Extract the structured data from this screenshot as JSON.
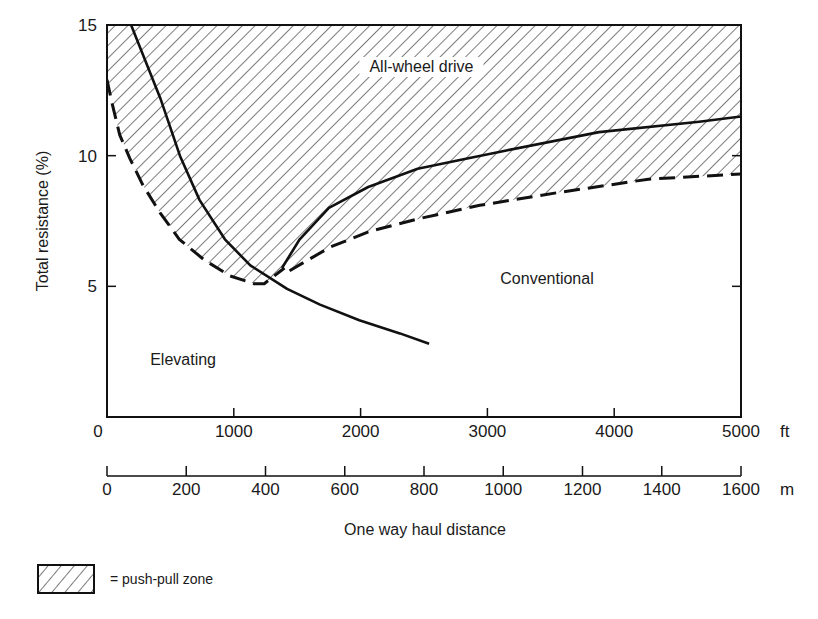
{
  "chart_data": {
    "type": "line",
    "title": "",
    "xlabel": "One way haul distance",
    "ylabel": "Total resistance (%)",
    "xlim": [
      0,
      5000
    ],
    "ylim": [
      0,
      15
    ],
    "x_unit": "ft",
    "x2_unit": "m",
    "x_ticks": [
      0,
      1000,
      2000,
      3000,
      4000,
      5000
    ],
    "x_tick_labels": [
      "0",
      "1000",
      "2000",
      "3000",
      "4000",
      "5000"
    ],
    "x2_ticks_m": [
      0,
      200,
      400,
      600,
      800,
      1000,
      1200,
      1400,
      1600
    ],
    "x2_tick_labels": [
      "0",
      "200",
      "400",
      "600",
      "800",
      "1000",
      "1200",
      "1400",
      "1600"
    ],
    "y_ticks": [
      5,
      10,
      15
    ],
    "y_tick_labels": [
      "5",
      "10",
      "15"
    ],
    "y_zero_label": "0",
    "grid": false,
    "series": [
      {
        "name": "Elevating / all-wheel boundary",
        "style": "solid",
        "points": [
          [
            190,
            15
          ],
          [
            420,
            12.2
          ],
          [
            575,
            10.0
          ],
          [
            730,
            8.3
          ],
          [
            930,
            6.8
          ],
          [
            1130,
            5.8
          ],
          [
            1420,
            4.9
          ],
          [
            1680,
            4.3
          ],
          [
            1990,
            3.7
          ],
          [
            2310,
            3.2
          ],
          [
            2540,
            2.8
          ]
        ]
      },
      {
        "name": "Elevating push-pull lower bound",
        "style": "dashed",
        "points": [
          [
            0,
            12.9
          ],
          [
            40,
            12.0
          ],
          [
            100,
            10.8
          ],
          [
            180,
            9.9
          ],
          [
            280,
            8.9
          ],
          [
            420,
            7.8
          ],
          [
            570,
            6.8
          ],
          [
            770,
            6.0
          ],
          [
            970,
            5.4
          ],
          [
            1160,
            5.1
          ],
          [
            1240,
            5.1
          ],
          [
            1400,
            5.7
          ]
        ]
      },
      {
        "name": "Conventional / all-wheel boundary",
        "style": "solid",
        "points": [
          [
            1380,
            5.7
          ],
          [
            1520,
            6.8
          ],
          [
            1750,
            8.0
          ],
          [
            2060,
            8.8
          ],
          [
            2450,
            9.5
          ],
          [
            2850,
            9.9
          ],
          [
            3150,
            10.2
          ],
          [
            3880,
            10.9
          ],
          [
            4670,
            11.3
          ],
          [
            5000,
            11.5
          ]
        ]
      },
      {
        "name": "Conventional push-pull lower bound",
        "style": "dashed",
        "points": [
          [
            1440,
            5.6
          ],
          [
            1760,
            6.5
          ],
          [
            2070,
            7.1
          ],
          [
            2470,
            7.6
          ],
          [
            2940,
            8.1
          ],
          [
            3570,
            8.6
          ],
          [
            4270,
            9.1
          ],
          [
            5000,
            9.3
          ]
        ]
      }
    ],
    "annotations": [
      {
        "text": "All-wheel drive",
        "x": 2480,
        "y": 13.2
      },
      {
        "text": "Conventional",
        "x": 3470,
        "y": 5.1
      },
      {
        "text": "Elevating",
        "x": 600,
        "y": 2.0
      }
    ],
    "legend": {
      "position": "bottom-left",
      "entries": [
        {
          "label": "= push-pull zone",
          "pattern": "hatch"
        }
      ]
    }
  }
}
